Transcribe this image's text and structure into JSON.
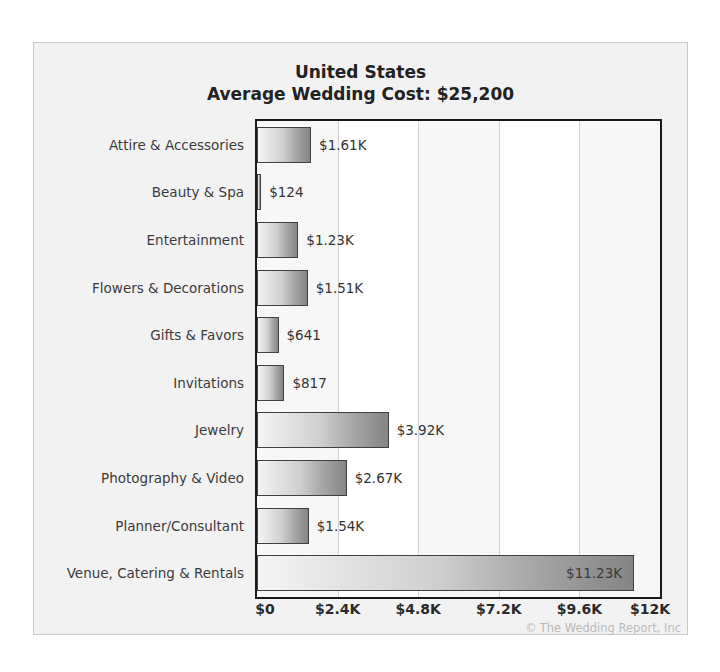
{
  "ghost_text": "a l  i   m",
  "chart_data": {
    "type": "bar",
    "orientation": "horizontal",
    "title": "United States",
    "subtitle": "Average Wedding Cost: $25,200",
    "xlabel": "",
    "ylabel": "",
    "xlim": [
      0,
      12000
    ],
    "grid": true,
    "legend": false,
    "categories": [
      "Attire & Accessories",
      "Beauty & Spa",
      "Entertainment",
      "Flowers & Decorations",
      "Gifts & Favors",
      "Invitations",
      "Jewelry",
      "Photography & Video",
      "Planner/Consultant",
      "Venue, Catering & Rentals"
    ],
    "values": [
      1610,
      124,
      1230,
      1510,
      641,
      817,
      3920,
      2670,
      1540,
      11230
    ],
    "value_labels": [
      "$1.61K",
      "$124",
      "$1.23K",
      "$1.51K",
      "$641",
      "$817",
      "$3.92K",
      "$2.67K",
      "$1.54K",
      "$11.23K"
    ],
    "label_placement": [
      "outside",
      "outside",
      "outside",
      "outside",
      "outside",
      "outside",
      "outside",
      "outside",
      "outside",
      "inside"
    ],
    "xticks": [
      0,
      2400,
      4800,
      7200,
      9600,
      12000
    ],
    "xtick_labels": [
      "$0",
      "$2.4K",
      "$4.8K",
      "$7.2K",
      "$9.6K",
      "$12K"
    ]
  },
  "copyright": {
    "mark": "©",
    "text": "The Wedding Report, Inc"
  },
  "colors": {
    "figure_background": "#f2f2f2",
    "plot_background": "#ffffff",
    "plot_border": "#1a1a1a",
    "gridline": "#d2d2d2",
    "bar_light": "#f4f4f4",
    "bar_dark": "#858585",
    "bar_border": "#404040",
    "text": "#3b3b3b",
    "title_text": "#222222",
    "copyright_text": "#b9b9b9"
  }
}
